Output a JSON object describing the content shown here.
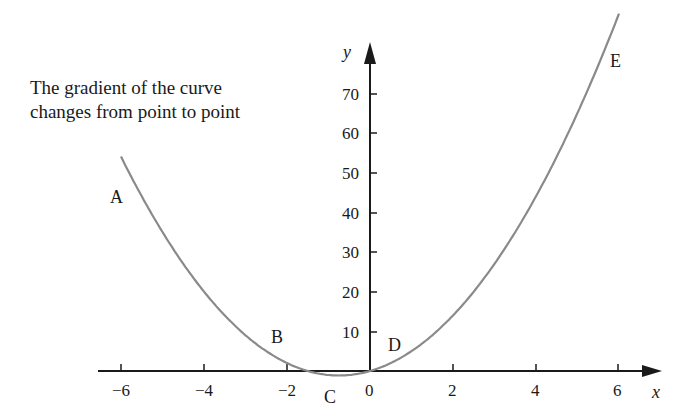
{
  "caption": {
    "line1": "The gradient of the curve",
    "line2": "changes from point to point"
  },
  "chart_data": {
    "type": "line",
    "title": "The gradient of the curve changes from point to point",
    "xlabel": "x",
    "ylabel": "y",
    "xlim": [
      -6.3,
      6.8
    ],
    "ylim": [
      -5,
      90
    ],
    "x_ticks": [
      "-6",
      "-4",
      "-2",
      "0",
      "2",
      "4",
      "6"
    ],
    "y_ticks": [
      "10",
      "20",
      "30",
      "40",
      "50",
      "60",
      "70"
    ],
    "grid": false,
    "series": [
      {
        "name": "y = 2x^2 + 3x",
        "x": [
          -6,
          -5,
          -4,
          -3,
          -2,
          -1.5,
          -0.75,
          0,
          1,
          2,
          3,
          4,
          5,
          6
        ],
        "values": [
          54,
          35,
          20,
          9,
          2,
          0,
          -1.125,
          0,
          5,
          14,
          27,
          44,
          65,
          90
        ],
        "color": "#8a8a8a"
      }
    ],
    "annotations": [
      {
        "label": "A",
        "x": -6,
        "y": 54
      },
      {
        "label": "B",
        "x": -2,
        "y": 2
      },
      {
        "label": "C",
        "x": -0.75,
        "y": -1.125
      },
      {
        "label": "D",
        "x": 0.5,
        "y": 2
      },
      {
        "label": "E",
        "x": 6,
        "y": 90
      }
    ]
  },
  "labels": {
    "A": "A",
    "B": "B",
    "C": "C",
    "D": "D",
    "E": "E",
    "x_axis": "x",
    "y_axis": "y",
    "xt": [
      "−6",
      "−4",
      "−2",
      "0",
      "2",
      "4",
      "6"
    ],
    "yt": [
      "10",
      "20",
      "30",
      "40",
      "50",
      "60",
      "70"
    ]
  }
}
